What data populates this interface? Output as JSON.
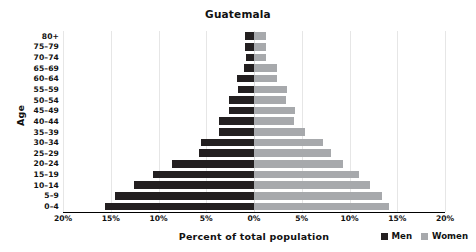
{
  "chart_data": {
    "type": "bar",
    "title": "Guatemala",
    "xlabel": "Percent of total population",
    "ylabel": "Age",
    "categories": [
      "80+",
      "75–79",
      "70–74",
      "65–69",
      "60–64",
      "55–59",
      "50–54",
      "45–49",
      "40–44",
      "35–39",
      "30–34",
      "25–29",
      "20–24",
      "15–19",
      "10–14",
      "5–9",
      "0–4"
    ],
    "series": [
      {
        "name": "Men",
        "color": "#231f20",
        "values": [
          0.95,
          0.95,
          0.85,
          1.05,
          1.8,
          1.7,
          2.6,
          2.6,
          3.7,
          3.7,
          5.6,
          5.8,
          8.6,
          10.6,
          12.6,
          14.6,
          15.6
        ]
      },
      {
        "name": "Women",
        "color": "#a7a9ac",
        "values": [
          1.25,
          1.25,
          1.25,
          2.4,
          2.4,
          3.5,
          3.3,
          4.3,
          4.2,
          5.3,
          7.2,
          8.1,
          9.3,
          11.0,
          12.1,
          13.4,
          14.1
        ]
      }
    ],
    "xticks": [
      "20%",
      "15%",
      "10%",
      "5%",
      "0%",
      "5%",
      "10%",
      "15%",
      "20%"
    ],
    "xtick_values": [
      -20,
      -15,
      -10,
      -5,
      0,
      5,
      10,
      15,
      20
    ],
    "xlim": [
      -20,
      20
    ],
    "grid": true,
    "legend_position": "bottom-right"
  },
  "legend": {
    "men_label": "Men",
    "women_label": "Women"
  }
}
